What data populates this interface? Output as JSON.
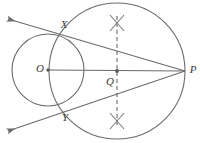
{
  "diagram": {
    "background_color": "#ffffff",
    "stroke_color": "#6b6b6b",
    "label_color": "#3b3b3b",
    "canvas": {
      "width": 200,
      "height": 143
    },
    "points": [
      {
        "id": "O",
        "label": "O",
        "x": 48,
        "y": 70,
        "label_x": 40,
        "label_y": 69,
        "role": "center-of-given-circle"
      },
      {
        "id": "Q",
        "label": "Q",
        "x": 117,
        "y": 71,
        "label_x": 110,
        "label_y": 82,
        "role": "midpoint-of-OP"
      },
      {
        "id": "P",
        "label": "P",
        "x": 185,
        "y": 71,
        "label_x": 193,
        "label_y": 70,
        "role": "external-point"
      },
      {
        "id": "X",
        "label": "X",
        "x": 72,
        "y": 38,
        "label_x": 64,
        "label_y": 25,
        "role": "tangent-point-upper"
      },
      {
        "id": "Y",
        "label": "Y",
        "x": 72,
        "y": 103,
        "label_x": 65,
        "label_y": 118,
        "role": "tangent-point-lower"
      }
    ],
    "circles": [
      {
        "id": "given-circle",
        "label": "circle with centre O",
        "cx": 48,
        "cy": 70,
        "r": 36,
        "style": "solid"
      },
      {
        "id": "construction-circle",
        "label": "circle with diameter OP",
        "cx": 117,
        "cy": 71,
        "r": 68,
        "style": "solid"
      }
    ],
    "segments": [
      {
        "id": "OP",
        "label": "O to P",
        "x1": 48,
        "y1": 70,
        "x2": 185,
        "y2": 71,
        "style": "solid"
      }
    ],
    "rays": [
      {
        "id": "tangent-upper",
        "label": "tangent through X",
        "from_x": 185,
        "from_y": 71,
        "through_x": 72,
        "through_y": 38,
        "end_x": 8,
        "end_y": 19,
        "arrow": "end",
        "style": "solid"
      },
      {
        "id": "tangent-lower",
        "label": "tangent through Y",
        "from_x": 185,
        "from_y": 71,
        "through_x": 72,
        "through_y": 103,
        "end_x": 8,
        "end_y": 131,
        "arrow": "end",
        "style": "solid"
      }
    ],
    "dashed_lines": [
      {
        "id": "perpendicular-bisector",
        "label": "perpendicular bisector of OP",
        "x1": 117,
        "y1": 16,
        "x2": 117,
        "y2": 126,
        "style": "dashed"
      }
    ],
    "arc_marks": [
      {
        "id": "arc-cross-top",
        "label": "X",
        "cx": 117,
        "cy": 22,
        "size": 9
      },
      {
        "id": "arc-cross-bottom",
        "label": "X",
        "cx": 117,
        "cy": 120,
        "size": 9
      }
    ]
  }
}
